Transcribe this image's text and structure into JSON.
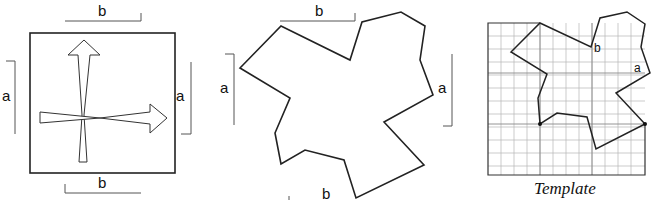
{
  "figure": {
    "panel_1": {
      "description": "square with two crossing arrows",
      "labels": {
        "top": "b",
        "bottom": "b",
        "left": "a",
        "right": "a"
      }
    },
    "panel_2": {
      "description": "star-like polygon tile",
      "labels": {
        "top": "b",
        "bottom": "b",
        "left": "a",
        "right": "a"
      }
    },
    "panel_3": {
      "description": "polygon drawn on grid",
      "labels": {
        "edge_b": "b",
        "edge_a": "a"
      },
      "caption": "Template"
    }
  },
  "colors": {
    "line": "#222222",
    "grid": "#b5b5b5",
    "bracket": "#555555"
  }
}
